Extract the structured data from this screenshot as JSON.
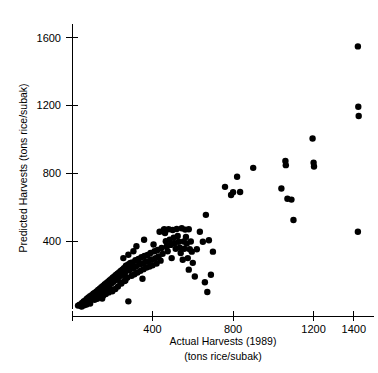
{
  "chart_data": {
    "type": "scatter",
    "title": "",
    "xlabel": "Actual Harvests (1989)",
    "xlabel_units": "(tons rice/subak)",
    "ylabel": "Predicted Harvests (tons rice/subak)",
    "xlim": [
      0,
      1500
    ],
    "ylim": [
      0,
      1680
    ],
    "xticks": [
      400,
      800,
      1200,
      1400
    ],
    "xticklabels": [
      "400",
      "800",
      "1200",
      "1400"
    ],
    "yticks": [
      400,
      800,
      1200,
      1600
    ],
    "yticklabels": [
      "400",
      "800",
      "1200",
      "1600"
    ],
    "grid": false,
    "legend": null,
    "marker": "circle",
    "marker_color": "#000000",
    "marker_size": 4.2,
    "points": [
      [
        30,
        20
      ],
      [
        38,
        26
      ],
      [
        45,
        18
      ],
      [
        50,
        35
      ],
      [
        55,
        28
      ],
      [
        58,
        45
      ],
      [
        62,
        30
      ],
      [
        66,
        50
      ],
      [
        70,
        38
      ],
      [
        74,
        60
      ],
      [
        78,
        44
      ],
      [
        82,
        68
      ],
      [
        86,
        52
      ],
      [
        90,
        75
      ],
      [
        94,
        58
      ],
      [
        98,
        82
      ],
      [
        102,
        64
      ],
      [
        106,
        90
      ],
      [
        110,
        70
      ],
      [
        114,
        96
      ],
      [
        118,
        78
      ],
      [
        122,
        104
      ],
      [
        126,
        86
      ],
      [
        130,
        112
      ],
      [
        134,
        92
      ],
      [
        138,
        120
      ],
      [
        142,
        100
      ],
      [
        146,
        128
      ],
      [
        150,
        106
      ],
      [
        154,
        136
      ],
      [
        158,
        114
      ],
      [
        162,
        145
      ],
      [
        166,
        122
      ],
      [
        170,
        152
      ],
      [
        174,
        130
      ],
      [
        178,
        160
      ],
      [
        182,
        138
      ],
      [
        186,
        168
      ],
      [
        190,
        146
      ],
      [
        194,
        176
      ],
      [
        198,
        154
      ],
      [
        202,
        184
      ],
      [
        206,
        162
      ],
      [
        210,
        192
      ],
      [
        214,
        170
      ],
      [
        218,
        200
      ],
      [
        222,
        178
      ],
      [
        226,
        208
      ],
      [
        230,
        186
      ],
      [
        234,
        216
      ],
      [
        238,
        194
      ],
      [
        242,
        224
      ],
      [
        246,
        202
      ],
      [
        250,
        232
      ],
      [
        254,
        210
      ],
      [
        258,
        240
      ],
      [
        262,
        218
      ],
      [
        266,
        248
      ],
      [
        270,
        226
      ],
      [
        274,
        256
      ],
      [
        278,
        234
      ],
      [
        282,
        264
      ],
      [
        286,
        242
      ],
      [
        290,
        272
      ],
      [
        200,
        105
      ],
      [
        215,
        118
      ],
      [
        228,
        132
      ],
      [
        245,
        150
      ],
      [
        260,
        165
      ],
      [
        168,
        88
      ],
      [
        182,
        98
      ],
      [
        196,
        112
      ],
      [
        155,
        80
      ],
      [
        140,
        72
      ],
      [
        125,
        60
      ],
      [
        112,
        54
      ],
      [
        255,
        300
      ],
      [
        262,
        200
      ],
      [
        268,
        255
      ],
      [
        275,
        185
      ],
      [
        280,
        320
      ],
      [
        285,
        228
      ],
      [
        292,
        265
      ],
      [
        296,
        196
      ],
      [
        300,
        275
      ],
      [
        305,
        240
      ],
      [
        310,
        205
      ],
      [
        315,
        288
      ],
      [
        318,
        252
      ],
      [
        320,
        370
      ],
      [
        325,
        215
      ],
      [
        330,
        295
      ],
      [
        335,
        262
      ],
      [
        340,
        225
      ],
      [
        345,
        305
      ],
      [
        350,
        268
      ],
      [
        355,
        235
      ],
      [
        358,
        408
      ],
      [
        360,
        312
      ],
      [
        365,
        278
      ],
      [
        370,
        245
      ],
      [
        375,
        318
      ],
      [
        380,
        282
      ],
      [
        385,
        250
      ],
      [
        390,
        330
      ],
      [
        395,
        292
      ],
      [
        400,
        258
      ],
      [
        405,
        380
      ],
      [
        410,
        340
      ],
      [
        415,
        300
      ],
      [
        420,
        268
      ],
      [
        425,
        348
      ],
      [
        430,
        310
      ],
      [
        435,
        455
      ],
      [
        440,
        285
      ],
      [
        445,
        360
      ],
      [
        450,
        325
      ],
      [
        455,
        465
      ],
      [
        458,
        470
      ],
      [
        462,
        448
      ],
      [
        466,
        400
      ],
      [
        470,
        368
      ],
      [
        475,
        340
      ],
      [
        480,
        470
      ],
      [
        485,
        408
      ],
      [
        490,
        378
      ],
      [
        495,
        300
      ],
      [
        500,
        466
      ],
      [
        505,
        420
      ],
      [
        510,
        388
      ],
      [
        515,
        355
      ],
      [
        520,
        472
      ],
      [
        525,
        430
      ],
      [
        530,
        396
      ],
      [
        535,
        362
      ],
      [
        540,
        330
      ],
      [
        545,
        476
      ],
      [
        550,
        290
      ],
      [
        555,
        398
      ],
      [
        558,
        355
      ],
      [
        562,
        468
      ],
      [
        566,
        425
      ],
      [
        570,
        386
      ],
      [
        575,
        300
      ],
      [
        580,
        470
      ],
      [
        585,
        352
      ],
      [
        590,
        398
      ],
      [
        595,
        338
      ],
      [
        600,
        272
      ],
      [
        610,
        192
      ],
      [
        620,
        352
      ],
      [
        635,
        455
      ],
      [
        650,
        396
      ],
      [
        660,
        158
      ],
      [
        665,
        555
      ],
      [
        672,
        100
      ],
      [
        680,
        405
      ],
      [
        690,
        202
      ],
      [
        700,
        338
      ],
      [
        760,
        720
      ],
      [
        790,
        672
      ],
      [
        800,
        688
      ],
      [
        820,
        780
      ],
      [
        835,
        690
      ],
      [
        900,
        832
      ],
      [
        1040,
        710
      ],
      [
        1060,
        872
      ],
      [
        1062,
        848
      ],
      [
        1070,
        650
      ],
      [
        1090,
        645
      ],
      [
        1100,
        525
      ],
      [
        1195,
        1005
      ],
      [
        1200,
        862
      ],
      [
        1202,
        840
      ],
      [
        1420,
        1548
      ],
      [
        1422,
        1192
      ],
      [
        1424,
        1138
      ],
      [
        1420,
        455
      ],
      [
        280,
        45
      ],
      [
        580,
        232
      ],
      [
        305,
        340
      ],
      [
        350,
        178
      ],
      [
        265,
        168
      ],
      [
        240,
        155
      ],
      [
        150,
        62
      ],
      [
        90,
        32
      ],
      [
        72,
        26
      ],
      [
        60,
        22
      ],
      [
        48,
        15
      ]
    ]
  }
}
